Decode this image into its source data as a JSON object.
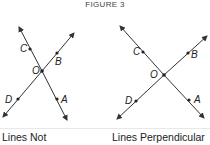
{
  "figure": {
    "title": "FIGURE 3"
  },
  "panels": [
    {
      "caption": "Lines Not",
      "intersection_label": "O",
      "points": {
        "C": "C",
        "B": "B",
        "D": "D",
        "A": "A",
        "O": "O"
      },
      "perpendicular": false
    },
    {
      "caption": "Lines Perpendicular",
      "intersection_label": "O",
      "points": {
        "C": "C",
        "B": "B",
        "D": "D",
        "A": "A",
        "O": "O"
      },
      "perpendicular": true
    }
  ],
  "colors": {
    "line": "#333333",
    "text": "#222222"
  }
}
